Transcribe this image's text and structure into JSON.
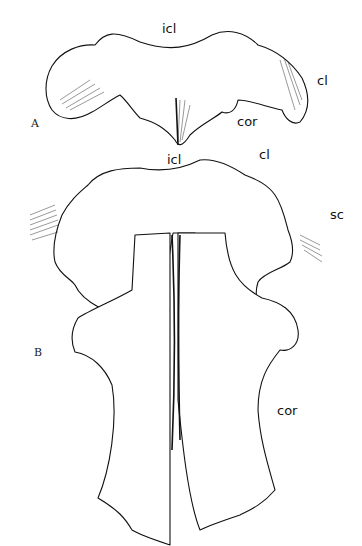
{
  "figure": {
    "panels": [
      {
        "id": "A",
        "label": "A",
        "annotations": [
          {
            "key": "icl",
            "text": "icl"
          },
          {
            "key": "cl",
            "text": "cl"
          },
          {
            "key": "cor",
            "text": "cor"
          }
        ]
      },
      {
        "id": "B",
        "label": "B",
        "annotations": [
          {
            "key": "icl",
            "text": "icl"
          },
          {
            "key": "cl",
            "text": "cl"
          },
          {
            "key": "sc",
            "text": "sc"
          },
          {
            "key": "cor",
            "text": "cor"
          }
        ]
      }
    ]
  }
}
